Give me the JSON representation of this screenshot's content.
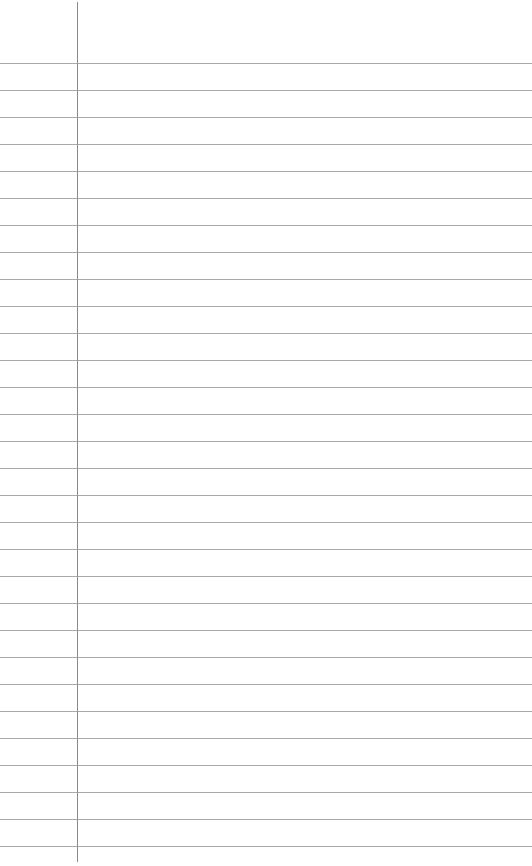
{
  "page": {
    "type": "lined-paper",
    "background": "#ffffff",
    "rule_color": "#9a9a9a",
    "margin_color": "#8a8a8a",
    "margin_x": 77,
    "first_rule_y": 63,
    "rule_spacing": 27,
    "rule_count": 30
  }
}
